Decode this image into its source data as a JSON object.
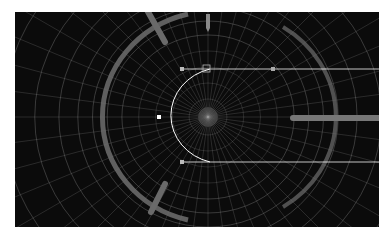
{
  "app": {
    "type": "3d-viewport",
    "view": "wireframe"
  },
  "side_label": "",
  "viewport": {
    "background_color": "#0b0b0b",
    "wire_color": "#9a9a9a",
    "highlight_color": "#ffffff",
    "ring_color": "#6e6e6e",
    "objects": [
      {
        "name": "radial-grid-dome",
        "kind": "wireframe"
      },
      {
        "name": "outer-ring",
        "kind": "torus-band"
      },
      {
        "name": "selected-curve",
        "kind": "arc-curve",
        "selected": true
      },
      {
        "name": "curve-control-point-top",
        "kind": "vertex"
      },
      {
        "name": "curve-control-point-left",
        "kind": "vertex"
      },
      {
        "name": "curve-control-point-bottom",
        "kind": "vertex"
      },
      {
        "name": "horizontal-rod-right",
        "kind": "bar"
      },
      {
        "name": "diagonal-strut-top-left",
        "kind": "bar"
      },
      {
        "name": "diagonal-strut-bottom-left",
        "kind": "bar"
      },
      {
        "name": "top-pointer",
        "kind": "marker"
      }
    ]
  }
}
